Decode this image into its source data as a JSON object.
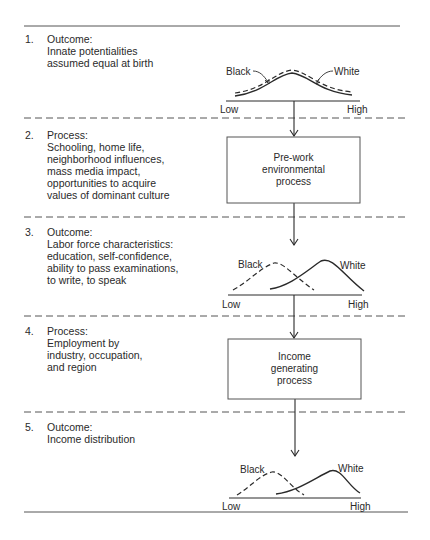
{
  "stages": [
    {
      "number": "1.",
      "type": "Outcome:",
      "lines": [
        "Innate potentialities",
        "assumed equal at birth"
      ],
      "graphic": "distribution",
      "distribution": {
        "black_label": "Black",
        "white_label": "White",
        "low": "Low",
        "high": "High",
        "relation": "equal"
      }
    },
    {
      "number": "2.",
      "type": "Process:",
      "lines": [
        "Schooling, home life,",
        "neighborhood influences,",
        "mass media impact,",
        "opportunities to acquire",
        "values of dominant culture"
      ],
      "graphic": "box",
      "box_lines": [
        "Pre-work",
        "environmental",
        "process"
      ]
    },
    {
      "number": "3.",
      "type": "Outcome:",
      "lines": [
        "Labor force characteristics:",
        "education, self-confidence,",
        "ability to pass examinations,",
        "to write, to speak"
      ],
      "graphic": "distribution",
      "distribution": {
        "black_label": "Black",
        "white_label": "White",
        "low": "Low",
        "high": "High",
        "relation": "black-shifted-low"
      }
    },
    {
      "number": "4.",
      "type": "Process:",
      "lines": [
        "Employment by",
        "industry, occupation,",
        "and region"
      ],
      "graphic": "box",
      "box_lines": [
        "Income",
        "generating",
        "process"
      ]
    },
    {
      "number": "5.",
      "type": "Outcome:",
      "lines": [
        "Income distribution"
      ],
      "graphic": "distribution",
      "distribution": {
        "black_label": "Black",
        "white_label": "White",
        "low": "Low",
        "high": "High",
        "relation": "black-shifted-low"
      }
    }
  ],
  "colors": {
    "ink": "#2a2a2a",
    "background": "#ffffff"
  }
}
